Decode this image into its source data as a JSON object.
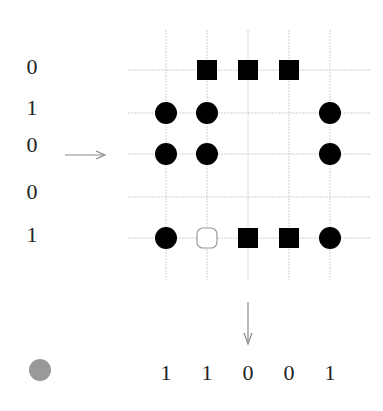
{
  "diagram": {
    "row_labels": [
      "0",
      "1",
      "0",
      "0",
      "1"
    ],
    "column_labels": [
      "1",
      "1",
      "0",
      "0",
      "1"
    ],
    "grid": {
      "rows": 5,
      "cols": 5,
      "cells": [
        [
          "empty",
          "square",
          "square",
          "square",
          "empty"
        ],
        [
          "circle",
          "circle",
          "empty",
          "empty",
          "circle"
        ],
        [
          "circle",
          "circle",
          "empty",
          "empty",
          "circle"
        ],
        [
          "empty",
          "empty",
          "empty",
          "empty",
          "empty"
        ],
        [
          "circle",
          "hollow",
          "square",
          "square",
          "circle"
        ]
      ]
    },
    "row_arrow": {
      "direction": "right",
      "row_index": 2
    },
    "column_arrow": {
      "direction": "down",
      "column_index": 2
    },
    "legend_dot": {
      "color": "#999999"
    },
    "colors": {
      "marker": "#000000",
      "grid": "#cccccc",
      "arrow": "#888888",
      "hollow": "#999999"
    }
  }
}
